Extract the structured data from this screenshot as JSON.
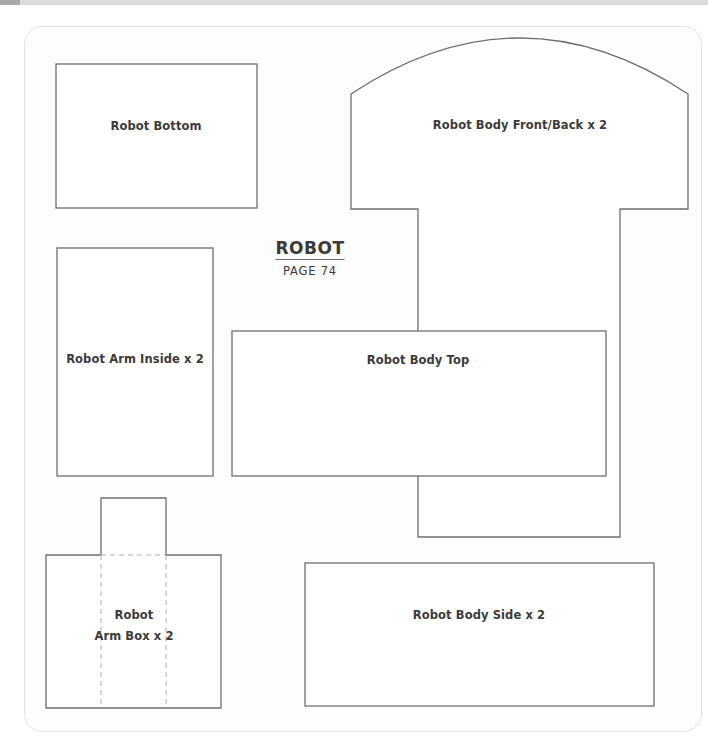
{
  "page": {
    "title": "ROBOT",
    "subtitle": "PAGE 74"
  },
  "colors": {
    "outline": "#6f6f6f",
    "fold_line": "#b0b0b0",
    "panel_border": "#e2e2e2",
    "text": "#3a3a3a"
  },
  "pieces": [
    {
      "id": "robot-bottom",
      "label": "Robot Bottom"
    },
    {
      "id": "robot-body-front-back",
      "label": "Robot Body Front/Back x 2"
    },
    {
      "id": "robot-arm-inside",
      "label": "Robot Arm Inside x 2"
    },
    {
      "id": "robot-body-top",
      "label": "Robot Body Top"
    },
    {
      "id": "robot-arm-box",
      "label_line1": "Robot",
      "label_line2": "Arm Box x 2"
    },
    {
      "id": "robot-body-side",
      "label": "Robot Body Side x 2"
    }
  ]
}
